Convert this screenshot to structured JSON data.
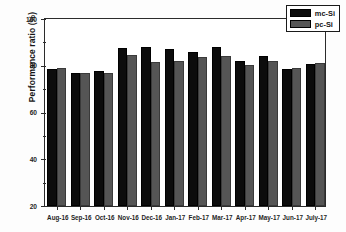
{
  "chart_data": {
    "type": "bar",
    "title": "",
    "xlabel": "",
    "ylabel": "Performance ratio (%)",
    "ylim": [
      20,
      100
    ],
    "ytick_labels": [
      "100",
      "80",
      "60",
      "40",
      "20"
    ],
    "ytick_values": [
      100,
      80,
      60,
      40,
      20
    ],
    "grid": false,
    "legend_position": "top-right",
    "categories": [
      "Aug-16",
      "Sep-16",
      "Oct-16",
      "Nov-16",
      "Dec-16",
      "Jan-17",
      "Feb-17",
      "Mar-17",
      "Apr-17",
      "May-17",
      "Jun-17",
      "July-17"
    ],
    "series": [
      {
        "name": "mc-Si",
        "color": "#0c0c0c",
        "values": [
          78.0,
          76.5,
          77.0,
          87.0,
          87.5,
          86.5,
          85.0,
          87.5,
          81.5,
          83.5,
          78.0,
          80.0
        ]
      },
      {
        "name": "pc-Si",
        "color": "#555555",
        "values": [
          78.5,
          76.5,
          76.5,
          84.0,
          81.0,
          81.5,
          83.0,
          83.5,
          79.5,
          81.5,
          78.5,
          80.5
        ]
      }
    ]
  }
}
